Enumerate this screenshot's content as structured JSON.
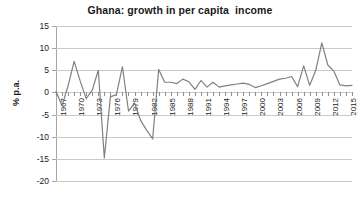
{
  "chart_data": {
    "type": "line",
    "title": "Ghana: growth in per capita  income",
    "xlabel": "",
    "ylabel": "% p.a.",
    "ylim": [
      -20,
      15
    ],
    "yticks": [
      15,
      10,
      5,
      0,
      -5,
      -10,
      -15,
      -20
    ],
    "ytick_labels": [
      "15",
      "10",
      "5",
      "0",
      "-5",
      "-10",
      "-15",
      "-20"
    ],
    "xlim": [
      1967,
      2016
    ],
    "xtick_labels": [
      "1967",
      "1970",
      "1973",
      "1976",
      "1979",
      "1982",
      "1985",
      "1988",
      "1991",
      "1994",
      "1997",
      "2000",
      "2003",
      "2006",
      "2009",
      "2012",
      "2015"
    ],
    "grid": true,
    "legend": false,
    "line_color": "#808080",
    "series": [
      {
        "name": "growth in per capita income",
        "x": [
          1967,
          1968,
          1969,
          1970,
          1971,
          1972,
          1973,
          1974,
          1975,
          1976,
          1977,
          1978,
          1979,
          1980,
          1981,
          1982,
          1983,
          1984,
          1985,
          1986,
          1987,
          1988,
          1989,
          1990,
          1991,
          1992,
          1993,
          1994,
          1995,
          1996,
          1997,
          1998,
          1999,
          2000,
          2001,
          2002,
          2003,
          2004,
          2005,
          2006,
          2007,
          2008,
          2009,
          2010,
          2011,
          2012,
          2013,
          2014,
          2015,
          2016
        ],
        "values": [
          0.2,
          -3.0,
          1.5,
          7.0,
          2.6,
          -1.4,
          0.5,
          5.0,
          -14.8,
          -1.0,
          -0.5,
          5.8,
          -4.2,
          -2.4,
          -6.3,
          -8.5,
          -10.5,
          5.2,
          2.3,
          2.3,
          2.0,
          3.0,
          2.4,
          0.7,
          2.7,
          1.2,
          2.3,
          1.2,
          1.5,
          1.7,
          1.9,
          2.1,
          1.8,
          1.1,
          1.5,
          2.0,
          2.5,
          3.0,
          3.2,
          3.6,
          1.3,
          6.0,
          1.6,
          5.0,
          11.2,
          6.2,
          4.8,
          1.7,
          1.5,
          1.6
        ]
      }
    ]
  }
}
